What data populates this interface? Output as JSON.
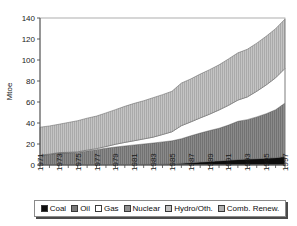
{
  "chart_data": {
    "type": "area",
    "stacked": true,
    "title": "",
    "xlabel": "",
    "ylabel": "Mtoe",
    "ylim": [
      0,
      140
    ],
    "yticks": [
      0,
      20,
      40,
      60,
      80,
      100,
      120,
      140
    ],
    "grid": false,
    "legend_position": "bottom",
    "x": [
      1971,
      1972,
      1973,
      1974,
      1975,
      1976,
      1977,
      1978,
      1979,
      1980,
      1981,
      1982,
      1983,
      1984,
      1985,
      1986,
      1987,
      1988,
      1989,
      1990,
      1991,
      1992,
      1993,
      1994,
      1995,
      1996,
      1997
    ],
    "xtick_labels": [
      "1971",
      "1973",
      "1975",
      "1977",
      "1979",
      "1981",
      "1983",
      "1985",
      "1987",
      "1989",
      "1991",
      "1993",
      "1995",
      "1997"
    ],
    "series": [
      {
        "name": "Coal",
        "color": "#0d0d0d",
        "values": [
          0.4,
          0.4,
          0.4,
          0.4,
          0.4,
          0.4,
          0.4,
          0.4,
          0.5,
          0.5,
          0.5,
          0.6,
          0.7,
          0.8,
          1.0,
          1.6,
          2.2,
          2.8,
          3.4,
          4.0,
          4.6,
          5.2,
          5.6,
          6.0,
          6.4,
          7.0,
          8.0
        ]
      },
      {
        "name": "Oil",
        "color": "#7a7a7a",
        "values": [
          8.6,
          9.6,
          11.0,
          11.2,
          11.6,
          13.0,
          14.2,
          15.6,
          16.6,
          17.6,
          18.6,
          19.4,
          20.2,
          21.2,
          22.0,
          23.4,
          25.6,
          27.6,
          29.4,
          31.0,
          33.4,
          36.4,
          37.6,
          39.8,
          42.4,
          45.6,
          51.0
        ]
      },
      {
        "name": "Gas",
        "color": "#ffffff",
        "values": [
          0.4,
          0.4,
          0.4,
          0.5,
          0.6,
          0.8,
          1.0,
          1.6,
          2.6,
          3.4,
          4.0,
          4.8,
          5.6,
          7.0,
          8.6,
          12.4,
          13.2,
          14.4,
          15.6,
          17.4,
          18.8,
          20.2,
          21.6,
          24.4,
          27.4,
          30.4,
          33.0
        ]
      },
      {
        "name": "Nuclear",
        "color": "#8f8f8f",
        "values": [
          0,
          0,
          0,
          0,
          0,
          0,
          0,
          0,
          0,
          0,
          0,
          0,
          0,
          0,
          0,
          0,
          0,
          0,
          0,
          0,
          0,
          0,
          0,
          0,
          0,
          0,
          0
        ]
      },
      {
        "name": "Hydro/Oth.",
        "color": "#b5b5b5",
        "values": [
          0,
          0,
          0,
          0,
          0,
          0,
          0,
          0,
          0,
          0,
          0,
          0,
          0,
          0,
          0,
          0,
          0,
          0,
          0,
          0,
          0,
          0,
          0,
          0,
          0,
          0,
          0
        ]
      },
      {
        "name": "Comb. Renew.",
        "color": "#b8b8b8",
        "values": [
          26.6,
          26.8,
          27.0,
          28.4,
          29.6,
          30.4,
          31.0,
          32.0,
          33.0,
          34.4,
          35.6,
          36.4,
          37.6,
          38.0,
          38.6,
          40.6,
          41.0,
          41.8,
          42.4,
          43.0,
          44.2,
          45.0,
          45.4,
          45.8,
          46.4,
          46.8,
          47.0
        ]
      }
    ]
  },
  "legend": {
    "items": [
      {
        "label": "Coal",
        "color": "#0d0d0d"
      },
      {
        "label": "Oil",
        "color": "#7a7a7a"
      },
      {
        "label": "Gas",
        "color": "#ffffff"
      },
      {
        "label": "Nuclear",
        "color": "#8f8f8f"
      },
      {
        "label": "Hydro/Oth.",
        "color": "#c2c2c2"
      },
      {
        "label": "Comb. Renew.",
        "color": "#b0b0b0"
      }
    ]
  }
}
